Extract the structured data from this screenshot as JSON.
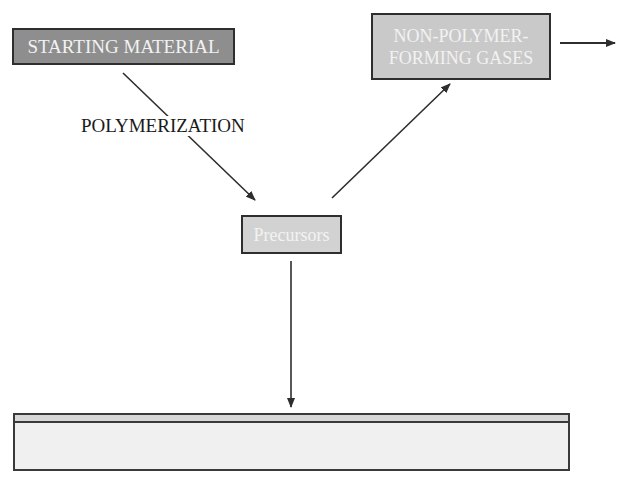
{
  "diagram": {
    "type": "process-flow",
    "nodes": {
      "starting_material": {
        "label": "STARTING MATERIAL",
        "fill": "#8e8e8e"
      },
      "non_polymer_gases": {
        "line1": "NON-POLYMER-",
        "line2": "FORMING GASES",
        "fill": "#c9c9c9"
      },
      "precursors": {
        "label": "Precursors",
        "fill": "#d2d2d2"
      },
      "substrate": {
        "label": "",
        "fill": "#f0f0f0",
        "film_fill": "#d8d8d8"
      }
    },
    "edges": [
      {
        "from": "starting_material",
        "to": "precursors",
        "label": "POLYMERIZATION"
      },
      {
        "from": "precursors",
        "to": "non_polymer_gases",
        "label": ""
      },
      {
        "from": "non_polymer_gases",
        "to": "exhaust",
        "label": ""
      },
      {
        "from": "precursors",
        "to": "substrate",
        "label": ""
      }
    ],
    "colors": {
      "line": "#2e2e2e",
      "text_dark": "#1a1a1a",
      "text_light": "#f2f2f2"
    }
  }
}
